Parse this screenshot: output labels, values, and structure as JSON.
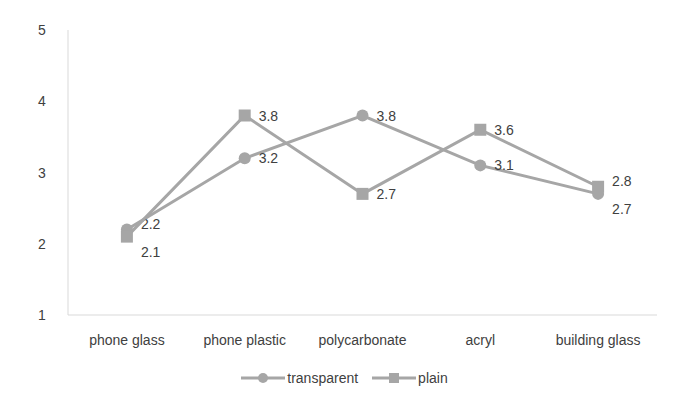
{
  "chart_data": {
    "type": "line",
    "title": "",
    "xlabel": "",
    "ylabel": "",
    "categories": [
      "phone glass",
      "phone plastic",
      "polycarbonate",
      "acryl",
      "building glass"
    ],
    "series": [
      {
        "name": "transparent",
        "marker": "circle",
        "color": "#a6a6a6",
        "values": [
          2.2,
          3.2,
          3.8,
          3.1,
          2.7
        ]
      },
      {
        "name": "plain",
        "marker": "square",
        "color": "#a6a6a6",
        "values": [
          2.1,
          3.8,
          2.7,
          3.6,
          2.8
        ]
      }
    ],
    "ylim": [
      1,
      5
    ],
    "yticks": [
      1,
      2,
      3,
      4,
      5
    ],
    "grid": false,
    "legend_position": "bottom",
    "data_labels": true
  },
  "legend": {
    "items": [
      {
        "label": "transparent"
      },
      {
        "label": "plain"
      }
    ]
  }
}
